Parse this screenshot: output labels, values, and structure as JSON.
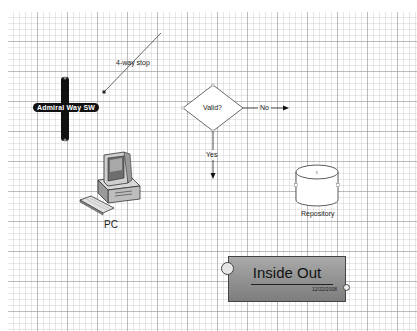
{
  "diagram": {
    "street_sign": {
      "label": "Admiral Way SW"
    },
    "connector": {
      "label": "4-way stop"
    },
    "decision": {
      "label": "Valid?",
      "no_label": "No",
      "yes_label": "Yes"
    },
    "computer": {
      "label": "PC"
    },
    "database": {
      "label": "Repository"
    },
    "title_block": {
      "title": "Inside Out",
      "date": "12/22/2008"
    }
  }
}
